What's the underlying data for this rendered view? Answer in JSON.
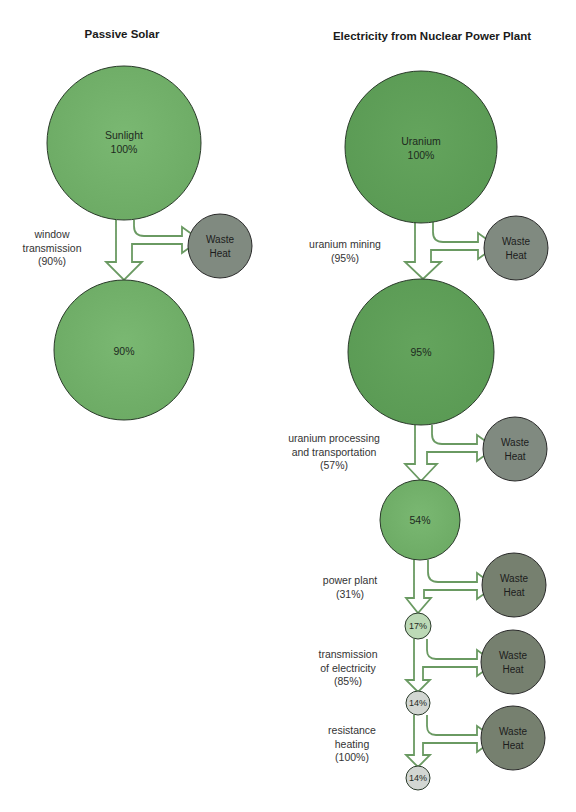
{
  "colors": {
    "green_dark": "#5e9e58",
    "green_mid": "#6fb066",
    "green_light": "#b9d8b3",
    "waste_gray": "#7f8a7f",
    "arrow_stroke": "#6a9a62",
    "circle_stroke": "#2a3a2a"
  },
  "passive_solar": {
    "title": "Passive Solar",
    "source": {
      "name": "Sunlight",
      "value": "100%"
    },
    "steps": [
      {
        "label_lines": [
          "window",
          "transmission",
          "(90%)"
        ],
        "efficiency": 90,
        "waste": "Waste Heat",
        "result": "90%"
      }
    ]
  },
  "nuclear": {
    "title": "Electricity from Nuclear Power Plant",
    "source": {
      "name": "Uranium",
      "value": "100%"
    },
    "steps": [
      {
        "label_lines": [
          "uranium mining",
          "(95%)"
        ],
        "efficiency": 95,
        "waste": "Waste Heat",
        "result": "95%"
      },
      {
        "label_lines": [
          "uranium processing",
          "and transportation",
          "(57%)"
        ],
        "efficiency": 57,
        "waste": "Waste Heat",
        "result": "54%"
      },
      {
        "label_lines": [
          "power plant",
          "(31%)"
        ],
        "efficiency": 31,
        "waste": "Waste Heat",
        "result": "17%"
      },
      {
        "label_lines": [
          "transmission",
          "of electricity",
          "(85%)"
        ],
        "efficiency": 85,
        "waste": "Waste Heat",
        "result": "14%"
      },
      {
        "label_lines": [
          "resistance",
          "heating",
          "(100%)"
        ],
        "efficiency": 100,
        "waste": "Waste Heat",
        "result": "14%"
      }
    ]
  },
  "waste": {
    "line1": "Waste",
    "line2": "Heat"
  }
}
